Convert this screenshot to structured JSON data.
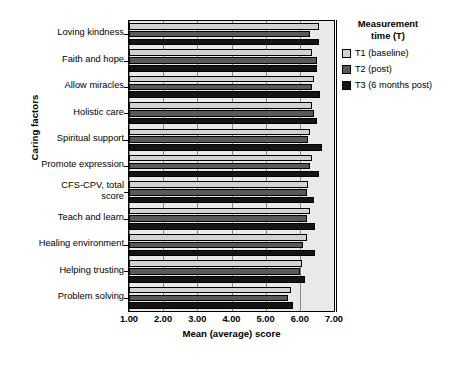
{
  "chart_data": {
    "type": "bar",
    "orientation": "horizontal",
    "title": "",
    "xlabel": "Mean (average) score",
    "ylabel": "Caring factors",
    "xlim": [
      1.0,
      7.0
    ],
    "xticks": [
      "1.00",
      "2.00",
      "3.00",
      "4.00",
      "5.00",
      "6.00",
      "7.00"
    ],
    "grid": true,
    "legend_position": "right",
    "legend_title": "Measurement\ntime (T)",
    "categories": [
      "Loving kindness",
      "Faith and hope",
      "Allow miracles",
      "Holistic care",
      "Spiritual support",
      "Promote expression",
      "CFS-CPV, total\nscore",
      "Teach and learn",
      "Healing environment",
      "Helping trusting",
      "Problem solving"
    ],
    "series": [
      {
        "name": "T1 (baseline)",
        "color": "#d2d2d2",
        "values": [
          6.55,
          6.35,
          6.4,
          6.35,
          6.3,
          6.35,
          6.25,
          6.3,
          6.2,
          6.05,
          5.75
        ]
      },
      {
        "name": "T2 (post)",
        "color": "#595959",
        "values": [
          6.3,
          6.5,
          6.35,
          6.4,
          6.25,
          6.3,
          6.2,
          6.2,
          6.1,
          6.0,
          5.65
        ]
      },
      {
        "name": "T3 (6 months post)",
        "color": "#141414",
        "values": [
          6.55,
          6.5,
          6.6,
          6.5,
          6.65,
          6.55,
          6.4,
          6.45,
          6.45,
          6.15,
          5.8
        ]
      }
    ]
  },
  "axes": {
    "y_title": "Caring factors",
    "x_title": "Mean (average) score"
  },
  "legend": {
    "title_line1": "Measurement",
    "title_line2": "time (T)",
    "items": [
      {
        "label": "T1 (baseline)",
        "color": "#d2d2d2"
      },
      {
        "label": "T2 (post)",
        "color": "#595959"
      },
      {
        "label": "T3 (6 months post)",
        "color": "#141414"
      }
    ]
  },
  "caption": ""
}
